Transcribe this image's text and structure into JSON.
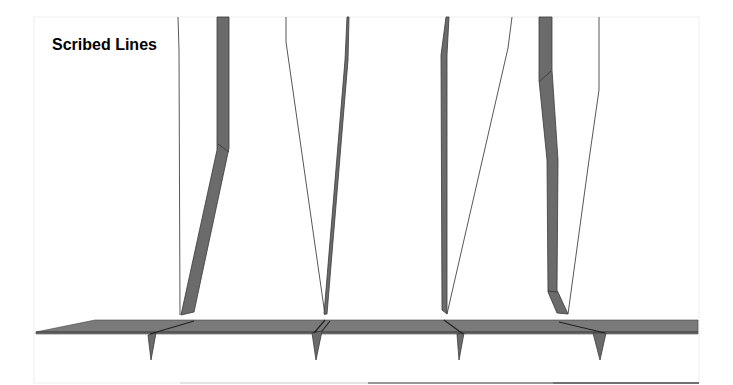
{
  "figure": {
    "title": "Scribed Lines",
    "colors": {
      "tool_fill": "#6b6b6b",
      "substrate_fill": "#7a7a7a",
      "outline": "#3a3a3a",
      "background": "#ffffff"
    },
    "tools": [
      {
        "id": 1,
        "label": "scribe-1"
      },
      {
        "id": 2,
        "label": "scribe-2"
      },
      {
        "id": 3,
        "label": "scribe-3"
      },
      {
        "id": 4,
        "label": "scribe-4"
      }
    ],
    "grooves_count": 4
  }
}
